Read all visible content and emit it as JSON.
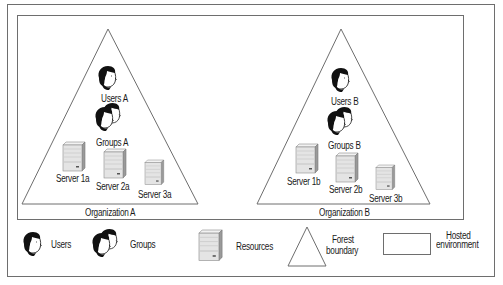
{
  "diagram": {
    "organizations": [
      {
        "name": "Organization A",
        "users_label": "Users A",
        "groups_label": "Groups A",
        "servers": [
          "Server 1a",
          "Server 2a",
          "Server 3a"
        ]
      },
      {
        "name": "Organization B",
        "users_label": "Users B",
        "groups_label": "Groups B",
        "servers": [
          "Server 1b",
          "Server 2b",
          "Server 3b"
        ]
      }
    ]
  },
  "legend": {
    "users": "Users",
    "groups": "Groups",
    "resources": "Resources",
    "forest_line1": "Forest",
    "forest_line2": "boundary",
    "hosted_line1": "Hosted",
    "hosted_line2": "environment"
  },
  "colors": {
    "line": "#6e6e6e",
    "server_light": "#e6e6e6",
    "server_mid": "#c8c8c8",
    "server_dark": "#8c8c8c",
    "hair": "#111111"
  }
}
